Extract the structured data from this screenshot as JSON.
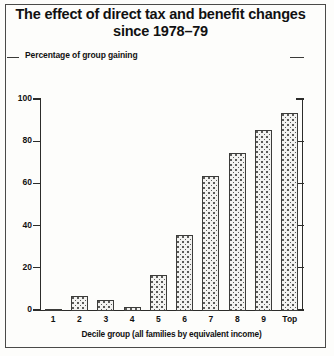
{
  "title": {
    "line1": "The effect of direct tax and benefit changes",
    "line2": "since 1978–79"
  },
  "chart_data": {
    "type": "bar",
    "title": "The effect of direct tax and benefit changes since 1978–79",
    "ylabel": "Percentage of group gaining",
    "xlabel": "Decile group (all families by equivalent income)",
    "categories": [
      "1",
      "2",
      "3",
      "4",
      "5",
      "6",
      "7",
      "8",
      "9",
      "Top"
    ],
    "values": [
      1,
      7,
      5,
      2,
      17,
      36,
      64,
      75,
      86,
      94
    ],
    "ylim": [
      0,
      100
    ],
    "yticks": [
      0,
      20,
      40,
      60,
      80,
      100
    ],
    "ytick_labels": [
      "0",
      "20",
      "40",
      "60",
      "80",
      "100"
    ],
    "grid": false,
    "legend": "none",
    "bar_fill": "#f2f2f0",
    "bar_outline": "#3c3c3a",
    "axis_color": "#2c2c2a",
    "background": "#fdfdfb"
  }
}
